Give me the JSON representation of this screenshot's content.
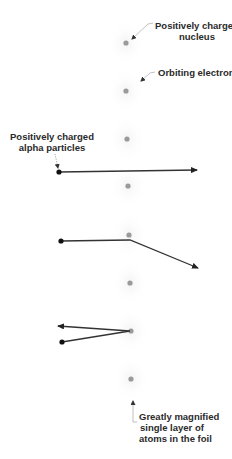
{
  "figure": {
    "colors": {
      "nucleus": "#9a9a9a",
      "electron_cloud": "#ececec",
      "alpha_particle": "#111111",
      "track": "#333333",
      "leader": "#b0b0b0",
      "text": "#2a2a2a"
    }
  },
  "labels": {
    "nucleus": {
      "line1": "Positively charged",
      "line2": "nucleus"
    },
    "electrons": {
      "line1": "Orbiting electrons"
    },
    "alpha": {
      "line1": "Positively charged",
      "line2": "alpha particles"
    },
    "foil": {
      "line1": "Greatly magnified",
      "line2": "single layer of",
      "line3": "atoms in the foil"
    }
  },
  "atoms": [
    {
      "x": 126,
      "y": 43
    },
    {
      "x": 126,
      "y": 91
    },
    {
      "x": 127,
      "y": 139
    },
    {
      "x": 128,
      "y": 186
    },
    {
      "x": 129,
      "y": 235
    },
    {
      "x": 130,
      "y": 283
    },
    {
      "x": 131,
      "y": 331
    },
    {
      "x": 131,
      "y": 379
    }
  ],
  "trajectories": [
    {
      "name": "undeflected",
      "points": [
        [
          59,
          172
        ],
        [
          197,
          170
        ]
      ]
    },
    {
      "name": "deflected",
      "points": [
        [
          61,
          241
        ],
        [
          130,
          240
        ],
        [
          198,
          268
        ]
      ]
    },
    {
      "name": "backscattered",
      "points": [
        [
          62,
          342
        ],
        [
          130,
          331
        ],
        [
          58,
          326
        ]
      ]
    }
  ]
}
